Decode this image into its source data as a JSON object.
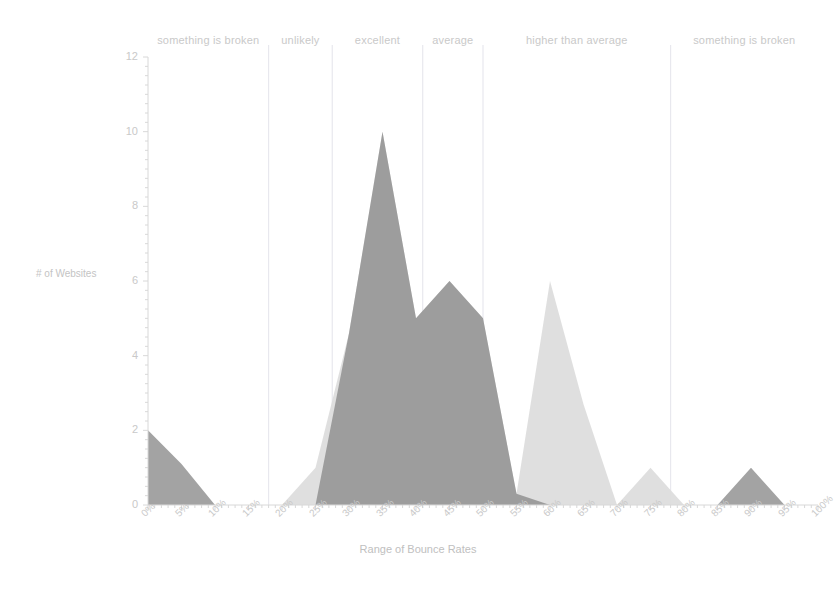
{
  "chart_data": {
    "type": "area",
    "title": "",
    "subtitle": "",
    "xlabel": "Range of Bounce Rates",
    "ylabel": "# of Websites",
    "x": [
      "0%",
      "5%",
      "10%",
      "15%",
      "20%",
      "25%",
      "30%",
      "35%",
      "40%",
      "45%",
      "50%",
      "55%",
      "60%",
      "65%",
      "70%",
      "75%",
      "80%",
      "85%",
      "90%",
      "95%",
      "100%"
    ],
    "x_numeric": [
      0,
      5,
      10,
      15,
      20,
      25,
      30,
      35,
      40,
      45,
      50,
      55,
      60,
      65,
      70,
      75,
      80,
      85,
      90,
      95,
      100
    ],
    "xlim": [
      0,
      100
    ],
    "ylim": [
      0,
      12
    ],
    "y_ticks": [
      0,
      2,
      4,
      6,
      8,
      10,
      12
    ],
    "grid": "vertical-band-separators-only",
    "legend": "none",
    "series": [
      {
        "name": "dark-series",
        "color": "#8c8c8c",
        "values": [
          2,
          1.1,
          0,
          0,
          0,
          0,
          4.6,
          10,
          5,
          6,
          5,
          0.3,
          0,
          0,
          0,
          0,
          0,
          0,
          1,
          0,
          0
        ]
      },
      {
        "name": "light-series",
        "color": "#dcdcdc",
        "values": [
          0,
          0,
          0,
          0,
          0,
          1,
          4.6,
          10,
          5,
          6,
          5,
          0.3,
          6,
          2.7,
          0,
          1,
          0,
          0,
          0,
          0,
          0
        ]
      }
    ],
    "bands": [
      {
        "label": "something is broken",
        "start": 0,
        "end": 18
      },
      {
        "label": "unlikely",
        "start": 18,
        "end": 27.5
      },
      {
        "label": "excellent",
        "start": 27.5,
        "end": 41
      },
      {
        "label": "average",
        "start": 41,
        "end": 50
      },
      {
        "label": "higher than average",
        "start": 50,
        "end": 78
      },
      {
        "label": "something is broken",
        "start": 78,
        "end": 100
      }
    ],
    "band_separators": [
      18,
      27.5,
      41,
      50,
      78
    ],
    "colors": {
      "axis": "#d8d8d8",
      "tick_text": "#c9c9c9",
      "band_text": "#c9c9c9",
      "gridline": "#e8e8ee",
      "series_dark": "#8c8c8c",
      "series_light": "#dcdcdc",
      "background": "#ffffff"
    }
  }
}
